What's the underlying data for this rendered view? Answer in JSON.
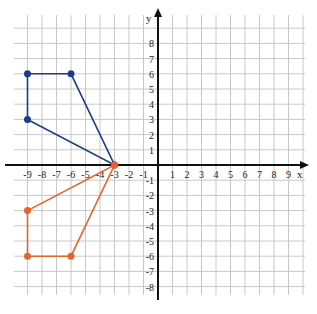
{
  "diagram": {
    "type": "coordinate-plane",
    "axes": {
      "x_label": "x",
      "y_label": "y",
      "x_ticks": [
        "-9",
        "-8",
        "-7",
        "-6",
        "-5",
        "-4",
        "-3",
        "-2",
        "-1",
        "1",
        "2",
        "3",
        "4",
        "5",
        "6",
        "7",
        "8",
        "9"
      ],
      "y_ticks": [
        "8",
        "7",
        "6",
        "5",
        "4",
        "3",
        "2",
        "1",
        "-1",
        "-2",
        "-3",
        "-4",
        "-5",
        "-6",
        "-7",
        "-8"
      ],
      "xlim": [
        -10,
        10
      ],
      "ylim": [
        -9,
        10
      ]
    },
    "shapes": [
      {
        "name": "blue-quadrilateral",
        "color": "#1f3a8a",
        "vertices": [
          [
            -9,
            6
          ],
          [
            -6,
            6
          ],
          [
            -3,
            0
          ],
          [
            -9,
            3
          ]
        ]
      },
      {
        "name": "orange-quadrilateral",
        "color": "#e8632b",
        "vertices": [
          [
            -9,
            -3
          ],
          [
            -3,
            0
          ],
          [
            -6,
            -6
          ],
          [
            -9,
            -6
          ]
        ]
      }
    ],
    "colors": {
      "grid": "#c8c8c8",
      "axis": "#111111"
    }
  }
}
